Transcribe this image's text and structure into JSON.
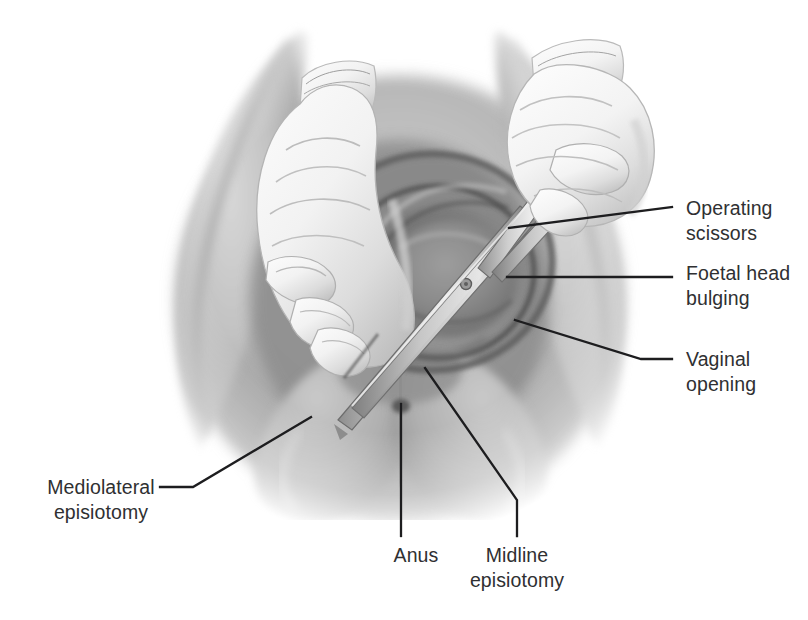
{
  "figure": {
    "kind": "medical-illustration",
    "style": "grayscale airbrush / pencil rendering",
    "background_color": "#ffffff",
    "label_color": "#2f3032",
    "leader_line_color": "#1d1d1f"
  },
  "labels": {
    "operating_scissors": {
      "line1": "Operating",
      "line2": "scissors"
    },
    "foetal_head": {
      "line1": "Foetal head",
      "line2": "bulging"
    },
    "vaginal_opening": {
      "line1": "Vaginal",
      "line2": "opening"
    },
    "mediolateral": {
      "line1": "Mediolateral",
      "line2": "episiotomy"
    },
    "anus": {
      "line1": "Anus",
      "line2": ""
    },
    "midline": {
      "line1": "Midline",
      "line2": "episiotomy"
    }
  },
  "anatomy": {
    "left_thigh": "left thigh and buttock",
    "right_thigh": "right thigh and buttock",
    "perineum": "perineum",
    "vulva": "vulval / vaginal opening with foetal head crowning",
    "anus_mark": "anus"
  },
  "instruments": {
    "operating_scissors": "episiotomy scissors held in right gloved hand",
    "gloved_left_hand": "gloved left hand guarding the foetal head",
    "gloved_right_hand": "gloved right hand holding scissors"
  },
  "leaders": {
    "operating_scissors": "from scissor blades up-right to label",
    "foetal_head": "horizontal from foetal head to label",
    "vaginal_opening": "from vaginal introitus down-right to label",
    "mediolateral": "from left postero-lateral perineum down-left to label",
    "anus": "vertical down from anus to label",
    "midline": "from midline perineum down-right to label"
  }
}
